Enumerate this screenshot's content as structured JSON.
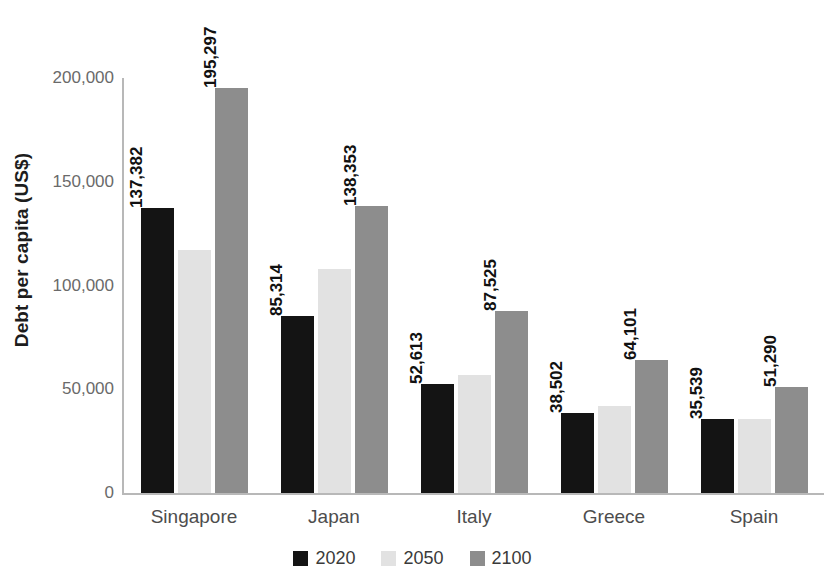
{
  "chart_data": {
    "type": "bar",
    "title": "",
    "subtitle": "",
    "xlabel": "",
    "ylabel": "Debt per capita (US$)",
    "ylim": [
      0,
      200000
    ],
    "yticks": [
      "0",
      "50,000",
      "100,000",
      "150,000",
      "200,000"
    ],
    "ytick_values": [
      0,
      50000,
      100000,
      150000,
      200000
    ],
    "grid": false,
    "legend_position": "bottom-center",
    "categories": [
      "Singapore",
      "Japan",
      "Italy",
      "Greece",
      "Spain"
    ],
    "series": [
      {
        "name": "2020",
        "color": "#141414",
        "values": [
          137382,
          85314,
          52613,
          38502,
          35539
        ],
        "labels": [
          "137,382",
          "85,314",
          "52,613",
          "38,502",
          "35,539"
        ]
      },
      {
        "name": "2050",
        "color": "#e2e2e2",
        "values": [
          117000,
          108000,
          57000,
          42000,
          35500
        ],
        "labels": [
          "",
          "",
          "",
          "",
          ""
        ]
      },
      {
        "name": "2100",
        "color": "#8d8d8d",
        "values": [
          195297,
          138353,
          87525,
          64101,
          51290
        ],
        "labels": [
          "195,297",
          "138,353",
          "87,525",
          "64,101",
          "51,290"
        ]
      }
    ]
  },
  "axis": {
    "y_title": "Debt per capita (US$)",
    "ticks": [
      {
        "label": "200,000",
        "value": 200000
      },
      {
        "label": "150,000",
        "value": 150000
      },
      {
        "label": "100,000",
        "value": 100000
      },
      {
        "label": "50,000",
        "value": 50000
      },
      {
        "label": "0",
        "value": 0
      }
    ]
  },
  "categories": [
    {
      "label": "Singapore"
    },
    {
      "label": "Japan"
    },
    {
      "label": "Italy"
    },
    {
      "label": "Greece"
    },
    {
      "label": "Spain"
    }
  ],
  "legend": {
    "items": [
      {
        "label": "2020",
        "color": "#141414"
      },
      {
        "label": "2050",
        "color": "#e2e2e2"
      },
      {
        "label": "2100",
        "color": "#8d8d8d"
      }
    ]
  },
  "colors": {
    "series_2020": "#141414",
    "series_2050": "#e2e2e2",
    "series_2100": "#8d8d8d",
    "axis": "#b8b8b8",
    "tick_text": "#6a6a6a",
    "category_text": "#4d4d4d",
    "label_text": "#111111",
    "background": "#ffffff"
  }
}
